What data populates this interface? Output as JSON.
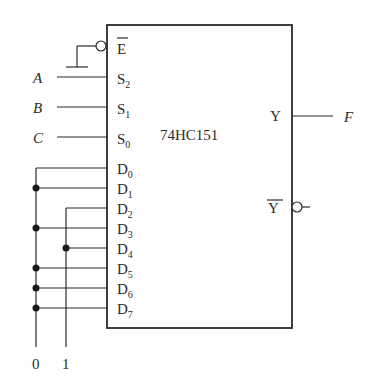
{
  "chip": {
    "name": "74HC151",
    "enable_label": "E",
    "select_labels": [
      "S2",
      "S1",
      "S0"
    ],
    "data_labels": [
      "D0",
      "D1",
      "D2",
      "D3",
      "D4",
      "D5",
      "D6",
      "D7"
    ],
    "output_label": "Y",
    "inverted_output_label": "Y"
  },
  "inputs": {
    "select_signals": [
      "A",
      "B",
      "C"
    ],
    "constant_buses": [
      {
        "label": "0",
        "connected_to": [
          "D0",
          "D1",
          "D3",
          "D5",
          "D6",
          "D7"
        ]
      },
      {
        "label": "1",
        "connected_to": [
          "D2",
          "D4"
        ]
      }
    ],
    "enable": "ground"
  },
  "outputs": {
    "Y": "F",
    "Y_bar": ""
  },
  "colors": {
    "line": "#2a2a2a",
    "background": "#ffffff"
  }
}
